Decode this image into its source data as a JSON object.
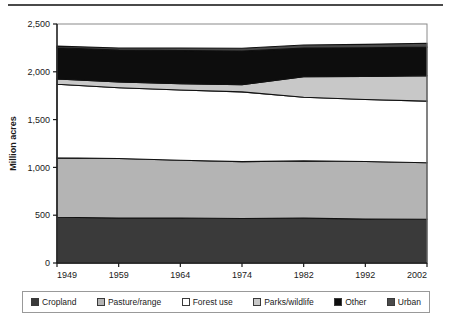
{
  "chart_data": {
    "type": "area",
    "title": "",
    "xlabel": "Year",
    "ylabel": "Million acres",
    "categories": [
      "1949",
      "1959",
      "1964",
      "1974",
      "1982",
      "1992",
      "2002"
    ],
    "x": [
      1949,
      1959,
      1964,
      1974,
      1982,
      1992,
      2002
    ],
    "ylim": [
      0,
      2500
    ],
    "ytick_labels": [
      "0",
      "500",
      "1,000",
      "1,500",
      "2,000",
      "2,500"
    ],
    "ytick_values": [
      0,
      500,
      1000,
      1500,
      2000,
      2500
    ],
    "grid": false,
    "stacked": true,
    "legend_position": "bottom",
    "series": [
      {
        "name": "Cropland",
        "color": "#3a3a3a",
        "values": [
          478,
          470,
          470,
          465,
          469,
          460,
          458
        ]
      },
      {
        "name": "Pasture/range",
        "color": "#b4b4b4",
        "values": [
          622,
          623,
          605,
          595,
          599,
          601,
          590
        ]
      },
      {
        "name": "Forest use",
        "color": "#ffffff",
        "values": [
          770,
          740,
          735,
          730,
          665,
          650,
          645
        ]
      },
      {
        "name": "Parks/wildlife",
        "color": "#c8c8c8",
        "values": [
          55,
          60,
          65,
          75,
          215,
          240,
          265
        ]
      },
      {
        "name": "Other",
        "color": "#0d0d0d",
        "values": [
          326,
          334,
          348,
          352,
          300,
          300,
          300
        ]
      },
      {
        "name": "Urban",
        "color": "#4a4a4a",
        "values": [
          18,
          22,
          26,
          30,
          33,
          36,
          40
        ]
      }
    ],
    "cumulative_tops": {
      "cropland": [
        478,
        470,
        470,
        465,
        469,
        460,
        458
      ],
      "pasture_range": [
        1100,
        1093,
        1075,
        1060,
        1068,
        1061,
        1048
      ],
      "forest_use": [
        1870,
        1833,
        1810,
        1790,
        1733,
        1711,
        1693
      ],
      "parks_wildlife": [
        1925,
        1893,
        1875,
        1865,
        1948,
        1951,
        1958
      ],
      "other": [
        2251,
        2227,
        2223,
        2217,
        2248,
        2251,
        2258
      ],
      "urban": [
        2269,
        2249,
        2249,
        2247,
        2281,
        2287,
        2298
      ]
    }
  },
  "axes": {
    "y_label": "Million acres",
    "x_label": "Year",
    "y_ticks": [
      "2,500",
      "2,000",
      "1,500",
      "1,000",
      "500",
      "0"
    ],
    "x_ticks": [
      "1949",
      "1959",
      "1964",
      "1974",
      "1982",
      "1992",
      "2002"
    ]
  },
  "legend": {
    "items": [
      {
        "label": "Cropland",
        "color": "#3a3a3a"
      },
      {
        "label": "Pasture/range",
        "color": "#b4b4b4"
      },
      {
        "label": "Forest use",
        "color": "#ffffff"
      },
      {
        "label": "Parks/wildlife",
        "color": "#c8c8c8"
      },
      {
        "label": "Other",
        "color": "#0d0d0d"
      },
      {
        "label": "Urban",
        "color": "#4a4a4a"
      }
    ]
  }
}
